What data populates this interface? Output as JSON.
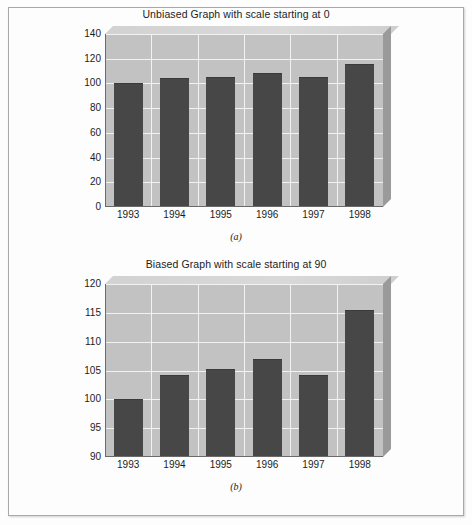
{
  "page": {
    "background_color": "#fdfdfd",
    "border_color": "#a9a9a9"
  },
  "style": {
    "plot_face_color": "#c2c2c2",
    "plot_top_color": "#d6d6d6",
    "plot_side_color": "#9a9a9a",
    "gridline_color": "#f2f2f2",
    "bar_color": "#474747",
    "axis_color": "#6a6a6a",
    "text_color": "#1c1c1c"
  },
  "figures": [
    {
      "caption": "(a)",
      "chart_data": {
        "type": "bar",
        "title": "Unbiased Graph with scale starting at 0",
        "xlabel": "",
        "ylabel": "",
        "categories": [
          "1993",
          "1994",
          "1995",
          "1996",
          "1997",
          "1998"
        ],
        "values": [
          100,
          104.5,
          105.5,
          108.5,
          105.5,
          116
        ],
        "ylim": [
          0,
          140
        ],
        "ytick_step": 20,
        "yticks": [
          0,
          20,
          40,
          60,
          80,
          100,
          120,
          140
        ],
        "ytick_labels": [
          "0",
          "20",
          "40",
          "60",
          "80",
          "100",
          "120",
          "140"
        ],
        "grid": true,
        "legend": false,
        "three_d": true
      }
    },
    {
      "caption": "(b)",
      "chart_data": {
        "type": "bar",
        "title": "Biased Graph with scale starting at 90",
        "xlabel": "",
        "ylabel": "",
        "categories": [
          "1993",
          "1994",
          "1995",
          "1996",
          "1997",
          "1998"
        ],
        "values": [
          100,
          104.3,
          105.2,
          107,
          104.3,
          115.5
        ],
        "ylim": [
          90,
          120
        ],
        "ytick_step": 5,
        "yticks": [
          90,
          95,
          100,
          105,
          110,
          115,
          120
        ],
        "ytick_labels": [
          "90",
          "95",
          "100",
          "105",
          "110",
          "115",
          "120"
        ],
        "grid": true,
        "legend": false,
        "three_d": true
      }
    }
  ]
}
